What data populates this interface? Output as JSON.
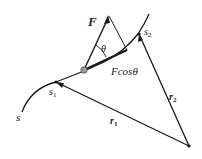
{
  "diagram": {
    "type": "physics-work-along-curve",
    "labels": {
      "force": "F",
      "angle": "θ",
      "projection": "Fcosθ",
      "path": "s",
      "start_point": "s",
      "start_sub": "1",
      "end_point": "s",
      "end_sub": "2",
      "r1": "r",
      "r1_sub": "1",
      "r2": "r",
      "r2_sub": "2"
    },
    "colors": {
      "line": "#1a1a1a",
      "particle": "#9a9a9a",
      "background": "#ffffff"
    }
  }
}
